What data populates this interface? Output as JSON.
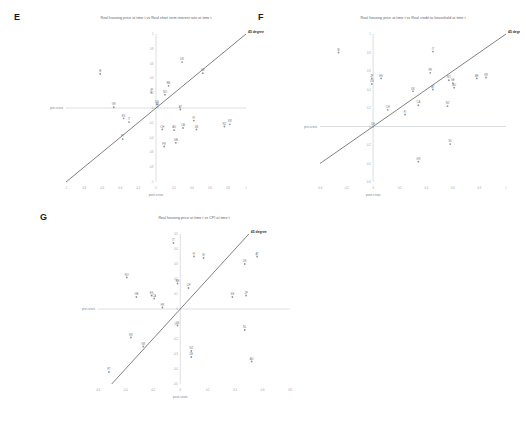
{
  "figure": {
    "background": "#ffffff",
    "accent_line_color": "#3d3d3d",
    "axis_color": "#b8bcc2",
    "point_color": "#8d949c"
  },
  "panels": [
    {
      "letter": "E",
      "title": "Real housing price at time t vs Real short term interest rate at time t",
      "xlabel": "post-crisis",
      "ylabel": "pre-crisis",
      "ref_label": "45 degree",
      "chart_data": {
        "type": "scatter",
        "title": "Real housing price at time t vs Real short term interest rate at time t",
        "xlabel": "post-crisis",
        "ylabel": "pre-crisis",
        "xlim": [
          -1,
          1
        ],
        "ylim": [
          -1,
          1
        ],
        "xticks": [
          -1,
          -0.8,
          -0.6,
          -0.4,
          -0.2,
          0,
          0.2,
          0.4,
          0.6,
          0.8,
          1
        ],
        "yticks": [
          -1,
          -0.8,
          -0.6,
          -0.4,
          -0.2,
          0,
          0.2,
          0.4,
          0.6,
          0.8,
          1
        ],
        "grid": false,
        "legend": "none",
        "reference_line": {
          "label": "45 degree",
          "slope": 1,
          "intercept": 0
        },
        "points": [
          {
            "label": "IE",
            "x": -0.62,
            "y": 0.46
          },
          {
            "label": "ES",
            "x": -0.36,
            "y": -0.14
          },
          {
            "label": "IT",
            "x": -0.3,
            "y": -0.19
          },
          {
            "label": "PT",
            "x": -0.37,
            "y": -0.42
          },
          {
            "label": "GR",
            "x": -0.47,
            "y": 0.01
          },
          {
            "label": "JP",
            "x": -0.05,
            "y": 0.21
          },
          {
            "label": "US",
            "x": 0.01,
            "y": 0.05
          },
          {
            "label": "NL",
            "x": 0.02,
            "y": 0.02
          },
          {
            "label": "BE",
            "x": 0.14,
            "y": 0.3
          },
          {
            "label": "NO",
            "x": 0.1,
            "y": 0.18
          },
          {
            "label": "DK",
            "x": 0.29,
            "y": 0.62
          },
          {
            "label": "SE",
            "x": 0.52,
            "y": 0.47
          },
          {
            "label": "AT",
            "x": 0.27,
            "y": -0.02
          },
          {
            "label": "FI",
            "x": 0.42,
            "y": -0.17
          },
          {
            "label": "CH",
            "x": 0.07,
            "y": -0.29
          },
          {
            "label": "AU",
            "x": 0.2,
            "y": -0.3
          },
          {
            "label": "CA",
            "x": 0.3,
            "y": -0.27
          },
          {
            "label": "DE",
            "x": 0.45,
            "y": -0.29
          },
          {
            "label": "NZ",
            "x": 0.76,
            "y": -0.25
          },
          {
            "label": "KR",
            "x": 0.82,
            "y": -0.22
          },
          {
            "label": "FR",
            "x": 0.09,
            "y": -0.52
          },
          {
            "label": "GB",
            "x": 0.22,
            "y": -0.47
          }
        ]
      }
    },
    {
      "letter": "F",
      "title": "Real housing price at time t vs Real credit to household at time t",
      "xlabel": "post-crisis",
      "ylabel": "pre-crisis",
      "ref_label": "45 degree",
      "chart_data": {
        "type": "scatter",
        "title": "Real housing price at time t vs Real credit to household at time t",
        "xlabel": "post-crisis",
        "ylabel": "pre-crisis",
        "xlim": [
          -0.4,
          1.0
        ],
        "ylim": [
          -0.6,
          1.0
        ],
        "xticks": [
          -0.4,
          -0.2,
          0,
          0.2,
          0.4,
          0.6,
          0.8,
          1.0
        ],
        "yticks": [
          -0.6,
          -0.4,
          -0.2,
          0,
          0.2,
          0.4,
          0.6,
          0.8,
          1.0
        ],
        "grid": false,
        "legend": "none",
        "reference_line": {
          "label": "45 degree",
          "slope": 1,
          "intercept": 0
        },
        "points": [
          {
            "label": "IE",
            "x": -0.26,
            "y": 0.8
          },
          {
            "label": "ES",
            "x": 0.06,
            "y": 0.52
          },
          {
            "label": "JP",
            "x": -0.01,
            "y": 0.52
          },
          {
            "label": "US",
            "x": -0.01,
            "y": 0.46
          },
          {
            "label": "IT",
            "x": 0.45,
            "y": 0.81
          },
          {
            "label": "FR",
            "x": 0.43,
            "y": 0.58
          },
          {
            "label": "NO",
            "x": 0.57,
            "y": 0.5
          },
          {
            "label": "SE",
            "x": 0.6,
            "y": 0.47
          },
          {
            "label": "AU",
            "x": 0.61,
            "y": 0.42
          },
          {
            "label": "BE",
            "x": 0.78,
            "y": 0.52
          },
          {
            "label": "KR",
            "x": 0.85,
            "y": 0.53
          },
          {
            "label": "AT",
            "x": 0.45,
            "y": 0.4
          },
          {
            "label": "DK",
            "x": 0.3,
            "y": 0.38
          },
          {
            "label": "CA",
            "x": 0.34,
            "y": 0.23
          },
          {
            "label": "NZ",
            "x": 0.56,
            "y": 0.22
          },
          {
            "label": "CH",
            "x": 0.11,
            "y": 0.18
          },
          {
            "label": "FI",
            "x": 0.24,
            "y": 0.13
          },
          {
            "label": "NL",
            "x": 0.58,
            "y": -0.19
          },
          {
            "label": "GR",
            "x": 0.34,
            "y": -0.38
          },
          {
            "label": "DE",
            "x": 0.0,
            "y": 0.0
          }
        ]
      }
    },
    {
      "letter": "G",
      "title": "Real housing price at time t vs CPI at time t",
      "xlabel": "post-crisis",
      "ylabel": "pre-crisis",
      "ref_label": "45 degree",
      "chart_data": {
        "type": "scatter",
        "title": "Real housing price at time t vs CPI at time t",
        "xlabel": "post-crisis",
        "ylabel": "pre-crisis",
        "xlim": [
          -0.6,
          0.8
        ],
        "ylim": [
          -0.5,
          0.5
        ],
        "xticks": [
          -0.6,
          -0.4,
          -0.2,
          0,
          0.2,
          0.4,
          0.6,
          0.8
        ],
        "yticks": [
          -0.5,
          -0.4,
          -0.3,
          -0.2,
          -0.1,
          0,
          0.1,
          0.2,
          0.3,
          0.4,
          0.5
        ],
        "grid": false,
        "legend": "none",
        "reference_line": {
          "label": "45 degree",
          "slope": 1,
          "intercept": 0
        },
        "points": [
          {
            "label": "IT",
            "x": -0.05,
            "y": 0.44
          },
          {
            "label": "FI",
            "x": 0.1,
            "y": 0.35
          },
          {
            "label": "IE",
            "x": 0.17,
            "y": 0.34
          },
          {
            "label": "DK",
            "x": 0.47,
            "y": 0.3
          },
          {
            "label": "AT",
            "x": 0.56,
            "y": 0.35
          },
          {
            "label": "NO",
            "x": -0.39,
            "y": 0.21
          },
          {
            "label": "BE",
            "x": -0.02,
            "y": 0.17
          },
          {
            "label": "GB",
            "x": -0.32,
            "y": 0.08
          },
          {
            "label": "ES",
            "x": -0.21,
            "y": 0.09
          },
          {
            "label": "CA",
            "x": -0.19,
            "y": 0.07
          },
          {
            "label": "CH",
            "x": 0.06,
            "y": 0.14
          },
          {
            "label": "SE",
            "x": 0.38,
            "y": 0.08
          },
          {
            "label": "JP",
            "x": 0.48,
            "y": 0.09
          },
          {
            "label": "FR",
            "x": -0.13,
            "y": 0.01
          },
          {
            "label": "US",
            "x": -0.02,
            "y": -0.11
          },
          {
            "label": "GR",
            "x": -0.27,
            "y": -0.25
          },
          {
            "label": "KR",
            "x": -0.36,
            "y": -0.19
          },
          {
            "label": "NL",
            "x": 0.47,
            "y": -0.14
          },
          {
            "label": "NZ",
            "x": 0.08,
            "y": -0.28
          },
          {
            "label": "DE",
            "x": 0.08,
            "y": -0.32
          },
          {
            "label": "AU",
            "x": 0.52,
            "y": -0.35
          },
          {
            "label": "PT",
            "x": -0.52,
            "y": -0.42
          }
        ]
      }
    }
  ]
}
